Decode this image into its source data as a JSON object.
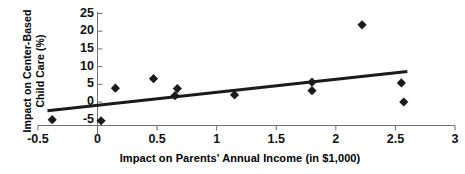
{
  "chart_data": {
    "type": "scatter",
    "title": "",
    "xlabel": "Impact on Parents' Annual Income (in $1,000)",
    "ylabel": "Impact on Center-Based Child Care (%)",
    "ylabel_lines": [
      "Impact on Center-Based",
      "Child Care (%)"
    ],
    "xlim": [
      -0.5,
      3
    ],
    "ylim": [
      -5,
      25
    ],
    "xticks": [
      -0.5,
      0,
      0.5,
      1,
      1.5,
      2,
      2.5,
      3
    ],
    "xtick_labels": [
      "-0.5",
      "0",
      "0.5",
      "1",
      "1.5",
      "2",
      "2.5",
      "3"
    ],
    "yticks": [
      -5,
      0,
      5,
      10,
      15,
      20,
      25
    ],
    "ytick_labels": [
      "-5",
      "0",
      "5",
      "10",
      "15",
      "20",
      "25"
    ],
    "grid": false,
    "legend": "none",
    "marker": "diamond",
    "marker_color": "#1a1a1a",
    "points": [
      {
        "x": -0.38,
        "y": -5.0
      },
      {
        "x": 0.03,
        "y": -5.3
      },
      {
        "x": 0.15,
        "y": 3.9
      },
      {
        "x": 0.47,
        "y": 6.6
      },
      {
        "x": 0.65,
        "y": 1.8
      },
      {
        "x": 0.67,
        "y": 3.8
      },
      {
        "x": 1.15,
        "y": 2.0
      },
      {
        "x": 1.8,
        "y": 5.6
      },
      {
        "x": 1.8,
        "y": 3.2
      },
      {
        "x": 2.22,
        "y": 21.8
      },
      {
        "x": 2.55,
        "y": 5.4
      },
      {
        "x": 2.57,
        "y": 0.0
      }
    ],
    "trendline": {
      "type": "linear",
      "color": "#1a1a1a",
      "x_start": -0.42,
      "y_start": -2.5,
      "x_end": 2.6,
      "y_end": 8.6
    }
  }
}
